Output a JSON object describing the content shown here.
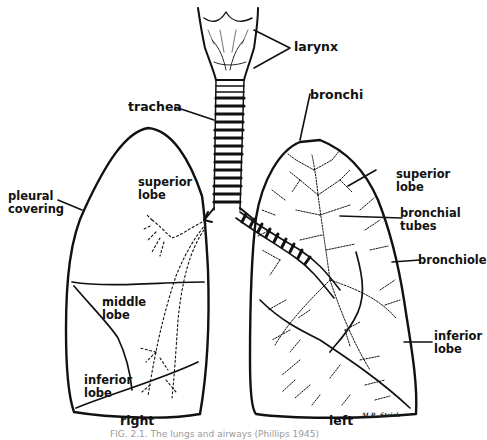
{
  "figure": {
    "type": "anatomical line drawing",
    "labels": {
      "larynx": "larynx",
      "trachea": "trachea",
      "bronchi": "bronchi",
      "pleural_covering": "pleural\ncovering",
      "right_superior_lobe": "superior\nlobe",
      "right_middle_lobe": "middle\nlobe",
      "right_inferior_lobe": "inferior\nlobe",
      "left_superior_lobe": "superior\nlobe",
      "bronchial_tubes": "bronchial\ntubes",
      "bronchiole": "bronchiole",
      "left_inferior_lobe": "inferior\nlobe",
      "right": "right",
      "left": "left"
    },
    "signature": "M.R. Strick",
    "caption": "FIG. 2.1. The lungs and airways (Phillips 1945)"
  },
  "colors": {
    "ink": "#111111",
    "background": "#ffffff",
    "caption": "#9a9a9a"
  }
}
